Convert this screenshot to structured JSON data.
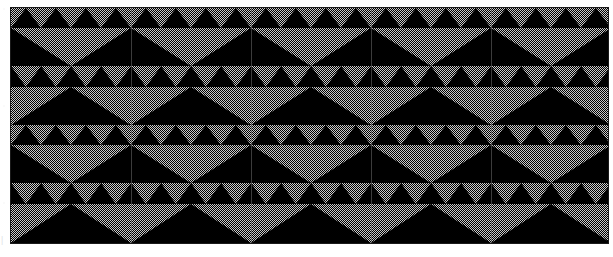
{
  "figure": {
    "kind": "geometric-tessellation-plate",
    "plate": {
      "x": 11,
      "y": 8,
      "width": 597,
      "height": 235,
      "background_color": "#000000",
      "border_color": "#1a1a1a"
    },
    "page": {
      "width": 613,
      "height": 257,
      "background_color": "#ffffff"
    },
    "palette": {
      "ink": "#000000",
      "halftone_gray": "#c9c9c9",
      "paper": "#ffffff",
      "rule": "#787878"
    },
    "halftone": {
      "type": "checkerboard-dither",
      "cell_px": 1,
      "coverage_percent": 50
    },
    "geometry": {
      "band_count": 4,
      "band_height": 58,
      "repeat_period": 120,
      "columns": 5,
      "small_triangle_width": 30,
      "small_triangle_height": 20,
      "large_triangle_width": 120,
      "large_triangle_height": 38
    },
    "bands": [
      {
        "index": 0,
        "name": "band-upward-light",
        "top": 0,
        "height": 58,
        "background": "halftone_gray",
        "figure_fill": "ink",
        "orientation": "up",
        "small_row_height": 20,
        "large_row_height": 38
      },
      {
        "index": 1,
        "name": "band-downward-dark",
        "top": 58,
        "height": 59,
        "background": "ink",
        "figure_fill": "halftone_gray",
        "orientation": "down",
        "small_row_height": 21,
        "large_row_height": 38
      },
      {
        "index": 2,
        "name": "band-upward-light",
        "top": 117,
        "height": 58,
        "background": "halftone_gray",
        "figure_fill": "ink",
        "orientation": "up",
        "small_row_height": 20,
        "large_row_height": 38
      },
      {
        "index": 3,
        "name": "band-downward-dark",
        "top": 175,
        "height": 60,
        "background": "ink",
        "figure_fill": "halftone_gray",
        "orientation": "down",
        "small_row_height": 21,
        "large_row_height": 39
      }
    ],
    "bottom_mark": {
      "label": "|",
      "visible": true
    }
  },
  "chart_data": {
    "type": "heatmap",
    "title": "",
    "xlabel": "",
    "ylabel": "",
    "legend": [],
    "annotations": [],
    "grid": false,
    "note": "Binary two-tone tessellation; values encode ink (1) versus halftone gray (0) regions",
    "categories": [
      "band-0",
      "band-1",
      "band-2",
      "band-3"
    ],
    "series": [
      {
        "name": "background_is_ink",
        "values": [
          0,
          1,
          0,
          1
        ]
      },
      {
        "name": "triangles_point_up",
        "values": [
          1,
          0,
          1,
          0
        ]
      },
      {
        "name": "small_triangles_per_band",
        "values": [
          20,
          20,
          20,
          20
        ]
      },
      {
        "name": "large_triangles_per_band",
        "values": [
          5,
          5,
          5,
          5
        ]
      }
    ]
  }
}
